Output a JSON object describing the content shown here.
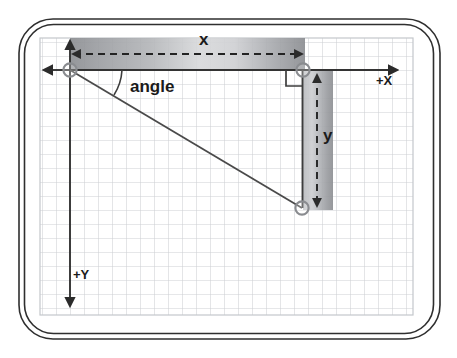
{
  "figure": {
    "title_hidden": "",
    "labels": {
      "x": "x",
      "y": "y",
      "angle": "angle",
      "plus_x": "+X",
      "plus_y": "+Y"
    },
    "icon_names": {
      "x_axis_arrow": "arrow-right-icon",
      "y_axis_arrow": "arrow-down-icon",
      "x_axis_arrow_left": "arrow-left-icon",
      "x_dimension_arrow": "double-arrow-horizontal-icon",
      "y_dimension_arrow": "double-arrow-vertical-icon",
      "right_angle_marker": "right-angle-icon",
      "angle_arc": "arc-icon"
    },
    "colors": {
      "frame_stroke": "#2b2b2b",
      "grid_line": "#c9ccd1",
      "axis_line": "#3a3a3a",
      "hypotenuse": "#4a4a4a",
      "band_dark": "#8f9094",
      "band_light": "#e6e7e9",
      "dash": "#2b2b2b",
      "node_stroke": "#8a8c90",
      "background": "#ffffff"
    },
    "geometry": {
      "grid": {
        "x": 40,
        "y": 38,
        "width": 373,
        "height": 277,
        "cell": 14
      },
      "origin_point": {
        "x": 70,
        "y": 70
      },
      "corner_point": {
        "x": 303,
        "y": 70
      },
      "end_point": {
        "x": 302,
        "y": 208
      },
      "x_band": {
        "x": 70,
        "y": 38,
        "width": 235,
        "height": 32
      },
      "y_band": {
        "x": 303,
        "y": 70,
        "width": 30,
        "height": 140
      },
      "x_axis_arrow_tip": {
        "x": 399,
        "y": 70
      },
      "y_axis_arrow_tip": {
        "x": 70,
        "y": 308
      },
      "x_axis_left_tip": {
        "x": 42,
        "y": 70
      }
    }
  }
}
